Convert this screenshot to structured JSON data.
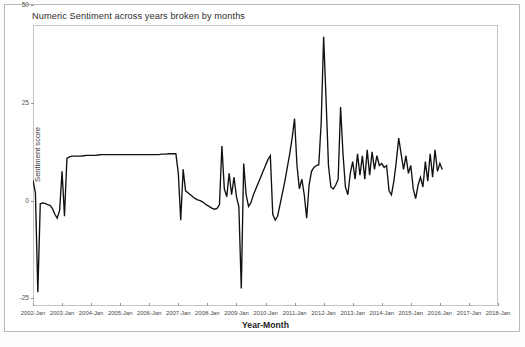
{
  "page": {
    "background_color": "#ffffff",
    "frame_color": "#b9b9b9"
  },
  "chart_data": {
    "type": "line",
    "title": "Numeric Sentiment across years broken by months",
    "xlabel": "Year-Month",
    "ylabel": "Sentiment score",
    "grid": false,
    "legend": "none",
    "line_color": "#111111",
    "ylim": [
      -27,
      45
    ],
    "yticks": [
      -25,
      0,
      25,
      50
    ],
    "ytick_labels": [
      "-25",
      "0",
      "25",
      "50"
    ],
    "xlim": [
      "2002-Jan",
      "2018-Jan"
    ],
    "xticks": [
      "2002-Jan",
      "2003-Jan",
      "2004-Jan",
      "2005-Jan",
      "2006-Jan",
      "2007-Jan",
      "2008-Jan",
      "2009-Jan",
      "2010-Jan",
      "2011-Jan",
      "2012-Jan",
      "2013-Jan",
      "2014-Jan",
      "2015-Jan",
      "2016-Jan",
      "2017-Jan",
      "2018-Jan"
    ],
    "series": [
      {
        "name": "Sentiment score",
        "x_start": "2002-Jan",
        "x_step_months": 1,
        "values": [
          5.2,
          2.0,
          -23.5,
          -0.8,
          -0.6,
          -0.7,
          -1.0,
          -1.2,
          -2.0,
          -3.5,
          -4.5,
          -2.5,
          7.5,
          -4.0,
          10.8,
          11.2,
          11.4,
          11.4,
          11.4,
          11.4,
          11.4,
          11.5,
          11.6,
          11.6,
          11.6,
          11.6,
          11.6,
          11.7,
          11.8,
          11.8,
          11.8,
          11.8,
          11.8,
          11.8,
          11.8,
          11.8,
          11.8,
          11.8,
          11.8,
          11.8,
          11.8,
          11.8,
          11.8,
          11.8,
          11.8,
          11.8,
          11.8,
          11.8,
          11.8,
          11.8,
          11.8,
          11.8,
          11.8,
          11.9,
          11.9,
          11.9,
          12.0,
          12.0,
          12.0,
          12.0,
          7.0,
          -5.0,
          8.0,
          2.5,
          2.0,
          1.5,
          1.0,
          0.5,
          0.2,
          0.0,
          -0.3,
          -0.8,
          -1.2,
          -1.6,
          -2.0,
          -2.2,
          -2.0,
          -1.0,
          14.0,
          3.0,
          1.0,
          7.0,
          1.5,
          6.0,
          1.0,
          -1.5,
          -22.5,
          9.5,
          1.5,
          -1.5,
          -0.5,
          1.5,
          3.0,
          4.5,
          6.0,
          7.5,
          9.0,
          10.5,
          11.5,
          -3.5,
          -5.0,
          -4.0,
          -1.0,
          2.0,
          5.0,
          8.5,
          12.0,
          16.0,
          21.0,
          9.0,
          3.0,
          5.5,
          1.5,
          -4.5,
          4.0,
          7.5,
          8.5,
          9.0,
          9.2,
          20.0,
          42.0,
          26.0,
          9.0,
          3.5,
          3.0,
          4.0,
          5.5,
          24.0,
          12.0,
          3.5,
          1.5,
          7.0,
          10.0,
          5.5,
          12.0,
          6.5,
          11.5,
          5.5,
          13.0,
          6.5,
          12.5,
          8.0,
          11.5,
          9.0,
          9.5,
          8.5,
          9.0,
          2.5,
          1.5,
          5.0,
          10.0,
          16.0,
          12.0,
          8.0,
          11.5,
          7.0,
          9.0,
          3.0,
          0.5,
          4.0,
          6.0,
          3.5,
          10.0,
          5.0,
          12.0,
          6.0,
          13.0,
          7.5,
          9.5,
          8.0
        ]
      }
    ]
  }
}
